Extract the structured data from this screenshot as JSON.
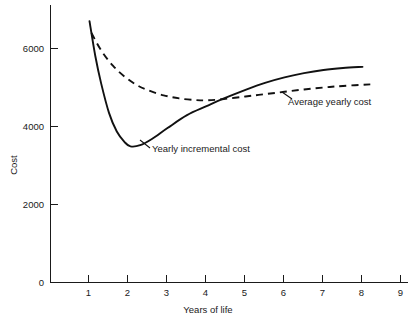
{
  "chart_data": {
    "type": "line",
    "title": "",
    "subtitle": "",
    "xlabel": "Years of life",
    "ylabel": "Cost",
    "xlim": [
      0,
      9
    ],
    "ylim": [
      0,
      7000
    ],
    "grid": false,
    "legend_position": "inline-annotations",
    "x_ticks": [
      {
        "value": 1,
        "label": "1"
      },
      {
        "value": 2,
        "label": "2"
      },
      {
        "value": 3,
        "label": "3"
      },
      {
        "value": 4,
        "label": "4"
      },
      {
        "value": 5,
        "label": "5"
      },
      {
        "value": 6,
        "label": "6"
      },
      {
        "value": 7,
        "label": "7"
      },
      {
        "value": 8,
        "label": "8"
      },
      {
        "value": 9,
        "label": "9"
      }
    ],
    "y_ticks": [
      {
        "value": 0,
        "label": "0"
      },
      {
        "value": 2000,
        "label": "2000"
      },
      {
        "value": 4000,
        "label": "4000"
      },
      {
        "value": 6000,
        "label": "6000"
      }
    ],
    "origin_label": "0",
    "series": [
      {
        "name": "Yearly incremental cost",
        "style": "solid",
        "color": "#111111",
        "annotation": "Yearly incremental cost",
        "x": [
          1.0,
          1.15,
          1.3,
          1.5,
          1.7,
          1.9,
          2.05,
          2.3,
          2.6,
          3.0,
          3.5,
          4.0,
          4.4,
          5.0,
          5.5,
          6.0,
          6.5,
          7.0,
          7.5,
          8.0
        ],
        "values": [
          6700,
          5800,
          5100,
          4350,
          3870,
          3600,
          3490,
          3520,
          3680,
          3960,
          4290,
          4520,
          4700,
          4940,
          5120,
          5260,
          5370,
          5450,
          5500,
          5530
        ]
      },
      {
        "name": "Average yearly cost",
        "style": "dashed",
        "color": "#111111",
        "annotation": "Average yearly cost",
        "x": [
          1.05,
          1.3,
          1.6,
          1.9,
          2.2,
          2.5,
          2.9,
          3.3,
          3.7,
          4.0,
          4.4,
          5.0,
          5.5,
          6.0,
          6.5,
          7.0,
          7.5,
          8.2
        ],
        "values": [
          6400,
          5950,
          5560,
          5280,
          5070,
          4930,
          4800,
          4720,
          4680,
          4670,
          4700,
          4770,
          4830,
          4890,
          4950,
          5000,
          5040,
          5080
        ]
      }
    ],
    "intersection": {
      "x": 4.4,
      "y": 4700
    }
  },
  "annotations": {
    "incremental": {
      "text": "Yearly incremental cost"
    },
    "average": {
      "text": "Average yearly cost"
    }
  }
}
